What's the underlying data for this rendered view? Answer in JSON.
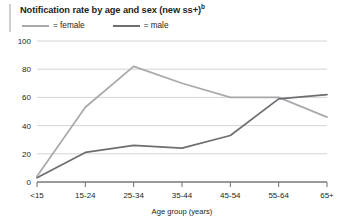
{
  "figure": {
    "title_main": "Notification rate by age and sex (new ss+)",
    "title_sup": "b",
    "left_rule": "vertical-rule"
  },
  "legend": {
    "position": "top-left",
    "items": [
      {
        "label": "= female",
        "color": "#a7a9ac",
        "key": "female"
      },
      {
        "label": "= male",
        "color": "#6d6e71",
        "key": "male"
      }
    ]
  },
  "axes": {
    "y_ticks": [
      "100",
      "80",
      "60",
      "40",
      "20",
      "0"
    ],
    "x_title": "Age group (years)",
    "y_title": ""
  },
  "chart_data": {
    "type": "line",
    "title": "Notification rate by age and sex (new ss+)",
    "xlabel": "Age group (years)",
    "ylabel": "",
    "ylim": [
      0,
      100
    ],
    "yticks": [
      0,
      20,
      40,
      60,
      80,
      100
    ],
    "grid": true,
    "legend_position": "top-left",
    "categories": [
      "<15",
      "15-24",
      "25-34",
      "35-44",
      "45-54",
      "55-64",
      "65+"
    ],
    "series": [
      {
        "name": "female",
        "color": "#a7a9ac",
        "values": [
          4,
          53,
          82,
          70,
          60,
          60,
          46
        ]
      },
      {
        "name": "male",
        "color": "#6d6e71",
        "values": [
          3,
          21,
          26,
          24,
          33,
          59,
          62
        ]
      }
    ]
  }
}
